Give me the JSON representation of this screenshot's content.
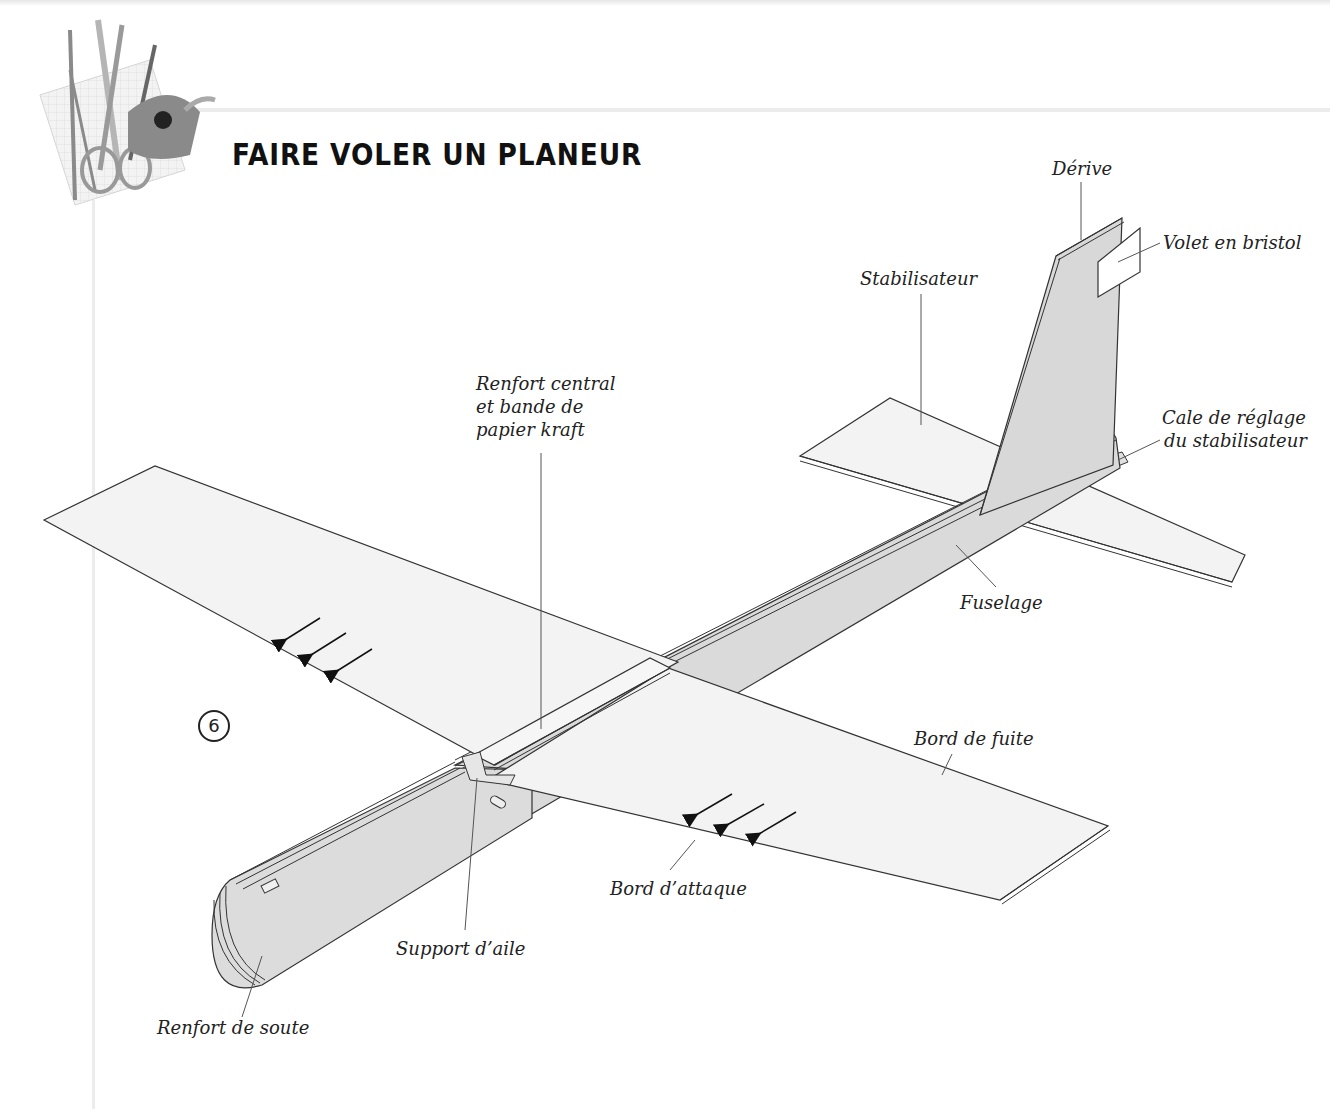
{
  "page": {
    "title": "FAIRE VOLER UN PLANEUR",
    "step_number": "6",
    "header_icon": "drafting-tools-icon"
  },
  "diagram": {
    "colors": {
      "fill_light": "#f2f2f2",
      "fill_mid": "#d6d6d6",
      "stroke": "#333333",
      "arrow": "#111111"
    },
    "labels": {
      "derive": "Dérive",
      "volet": "Volet en bristol",
      "stabilisateur": "Stabilisateur",
      "cale_line1": "Cale de réglage",
      "cale_line2": "du stabilisateur",
      "renfort_central_line1": "Renfort central",
      "renfort_central_line2": "et bande de",
      "renfort_central_line3": "papier kraft",
      "fuselage": "Fuselage",
      "bord_de_fuite": "Bord de fuite",
      "bord_attaque": "Bord d’attaque",
      "support_aile": "Support d’aile",
      "renfort_soute": "Renfort de soute"
    },
    "airflow_arrows": {
      "left_wing_count": 3,
      "right_wing_count": 3
    }
  }
}
